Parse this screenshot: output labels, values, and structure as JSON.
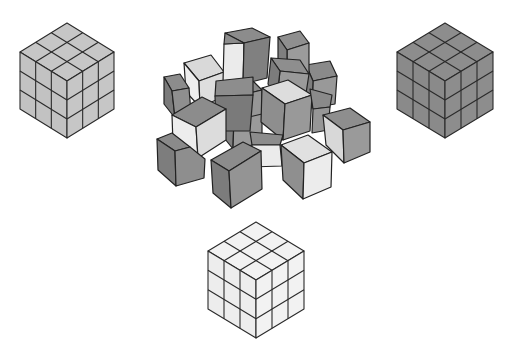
{
  "scene": {
    "title": "",
    "description": "Three assembled 3x3x3 cubes (light gray, dark gray, white) around a pile of loose unit cubes"
  },
  "cubes": [
    {
      "id": "left",
      "grid": 3,
      "color": "#c6c6c6",
      "top": [
        67,
        23
      ],
      "half_width": 47,
      "rise": 29,
      "height": 57
    },
    {
      "id": "right",
      "grid": 3,
      "color": "#8d8d8d",
      "top": [
        445,
        23
      ],
      "half_width": 48,
      "rise": 29,
      "height": 57
    },
    {
      "id": "bottom",
      "grid": 3,
      "color": "#f2f2f2",
      "top": [
        256,
        222
      ],
      "half_width": 48,
      "rise": 29,
      "height": 58
    }
  ],
  "pile": {
    "count_visible": 20,
    "colors": {
      "dark": "#8a8a8a",
      "mid": "#a9a9a9",
      "light": "#e6e6e6"
    }
  }
}
